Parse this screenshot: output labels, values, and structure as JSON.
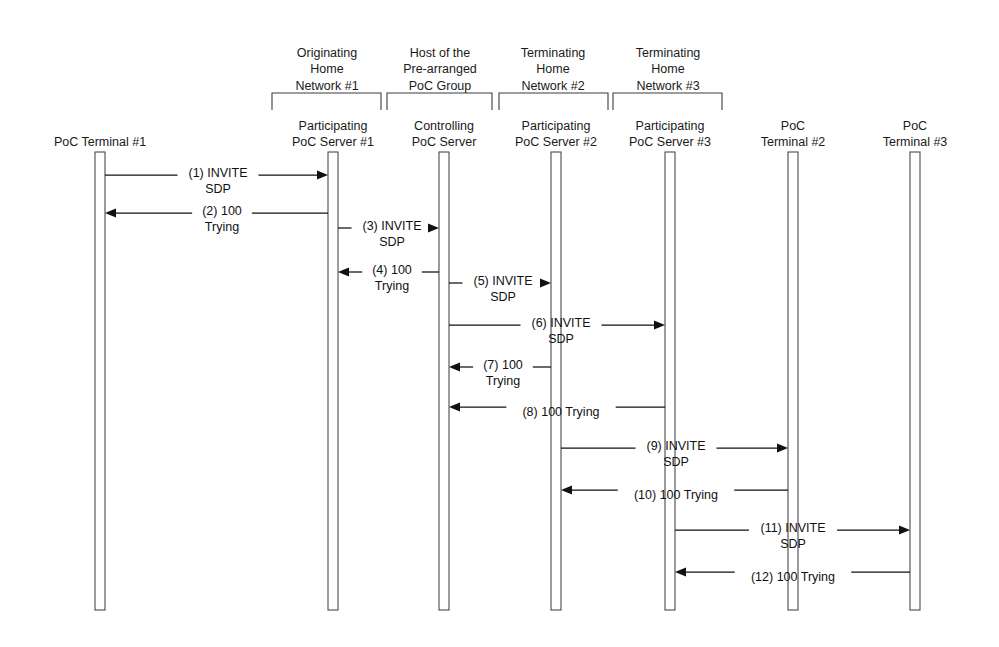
{
  "diagram": {
    "type": "sequence-diagram",
    "width": 999,
    "height": 647,
    "background": "#ffffff",
    "line_color": "#111111",
    "lifeline_stroke": "#4a4a4a"
  },
  "lifelines": [
    {
      "id": "t1",
      "label": "PoC Terminal #1",
      "label_lines": [
        "PoC Terminal #1"
      ],
      "x": 100,
      "top": 152,
      "bottom": 610,
      "width": 10
    },
    {
      "id": "p1",
      "label": "Participating PoC Server #1",
      "label_lines": [
        "Participating",
        "PoC Server #1"
      ],
      "x": 333,
      "top": 152,
      "bottom": 610,
      "width": 10
    },
    {
      "id": "cs",
      "label": "Controlling PoC Server",
      "label_lines": [
        "Controlling",
        "PoC Server"
      ],
      "x": 444,
      "top": 152,
      "bottom": 610,
      "width": 10
    },
    {
      "id": "p2",
      "label": "Participating PoC Server #2",
      "label_lines": [
        "Participating",
        "PoC Server #2"
      ],
      "x": 556,
      "top": 152,
      "bottom": 610,
      "width": 10
    },
    {
      "id": "p3",
      "label": "Participating PoC Server #3",
      "label_lines": [
        "Participating",
        "PoC Server #3"
      ],
      "x": 670,
      "top": 152,
      "bottom": 610,
      "width": 10
    },
    {
      "id": "t2",
      "label": "PoC Terminal #2",
      "label_lines": [
        "PoC",
        "Terminal #2"
      ],
      "x": 793,
      "top": 152,
      "bottom": 610,
      "width": 10
    },
    {
      "id": "t3",
      "label": "PoC Terminal #3",
      "label_lines": [
        "PoC",
        "Terminal #3"
      ],
      "x": 915,
      "top": 152,
      "bottom": 610,
      "width": 10
    }
  ],
  "groups": [
    {
      "id": "g1",
      "label_lines": [
        "Originating",
        "Home",
        "Network #1"
      ],
      "left": 272,
      "right": 381,
      "y": 93,
      "text_center": 327,
      "text_top": 40
    },
    {
      "id": "g2",
      "label_lines": [
        "Host of the",
        "Pre-arranged",
        "PoC Group"
      ],
      "left": 387,
      "right": 492,
      "y": 93,
      "text_center": 440,
      "text_top": 40
    },
    {
      "id": "g3",
      "label_lines": [
        "Terminating",
        "Home",
        "Network #2"
      ],
      "left": 499,
      "right": 608,
      "y": 93,
      "text_center": 553,
      "text_top": 40
    },
    {
      "id": "g4",
      "label_lines": [
        "Terminating",
        "Home",
        "Network #3"
      ],
      "left": 613,
      "right": 722,
      "y": 93,
      "text_center": 668,
      "text_top": 40
    }
  ],
  "messages": [
    {
      "num": "(1)",
      "text_lines": [
        "(1) INVITE",
        "SDP"
      ],
      "from": "t1",
      "to": "p1",
      "dir": "right",
      "y": 175,
      "label_center": 218,
      "label_top": 160
    },
    {
      "num": "(2)",
      "text_lines": [
        "(2) 100",
        "Trying"
      ],
      "from": "p1",
      "to": "t1",
      "dir": "left",
      "y": 213,
      "label_center": 222,
      "label_top": 198
    },
    {
      "num": "(3)",
      "text_lines": [
        "(3) INVITE",
        "SDP"
      ],
      "from": "p1",
      "to": "cs",
      "dir": "right",
      "y": 228,
      "label_center": 392,
      "label_top": 213
    },
    {
      "num": "(4)",
      "text_lines": [
        "(4) 100",
        "Trying"
      ],
      "from": "cs",
      "to": "p1",
      "dir": "left",
      "y": 272,
      "label_center": 392,
      "label_top": 257
    },
    {
      "num": "(5)",
      "text_lines": [
        "(5) INVITE",
        "SDP"
      ],
      "from": "cs",
      "to": "p2",
      "dir": "right",
      "y": 283,
      "label_center": 503,
      "label_top": 268
    },
    {
      "num": "(6)",
      "text_lines": [
        "(6) INVITE",
        "SDP"
      ],
      "from": "cs",
      "to": "p3",
      "dir": "right",
      "y": 325,
      "label_center": 561,
      "label_top": 310
    },
    {
      "num": "(7)",
      "text_lines": [
        "(7) 100",
        "Trying"
      ],
      "from": "p2",
      "to": "cs",
      "dir": "left",
      "y": 367,
      "label_center": 503,
      "label_top": 352
    },
    {
      "num": "(8)",
      "text_lines": [
        "(8) 100 Trying"
      ],
      "from": "p3",
      "to": "cs",
      "dir": "left",
      "y": 407,
      "label_center": 561,
      "label_top": 399
    },
    {
      "num": "(9)",
      "text_lines": [
        "(9) INVITE",
        "SDP"
      ],
      "from": "p2",
      "to": "t2",
      "dir": "right",
      "y": 448,
      "label_center": 676,
      "label_top": 433
    },
    {
      "num": "(10)",
      "text_lines": [
        "(10) 100 Trying"
      ],
      "from": "t2",
      "to": "p2",
      "dir": "left",
      "y": 490,
      "label_center": 676,
      "label_top": 482
    },
    {
      "num": "(11)",
      "text_lines": [
        "(11) INVITE",
        "SDP"
      ],
      "from": "p3",
      "to": "t3",
      "dir": "right",
      "y": 530,
      "label_center": 793,
      "label_top": 515
    },
    {
      "num": "(12)",
      "text_lines": [
        "(12) 100 Trying"
      ],
      "from": "t3",
      "to": "p3",
      "dir": "left",
      "y": 572,
      "label_center": 793,
      "label_top": 564
    }
  ]
}
